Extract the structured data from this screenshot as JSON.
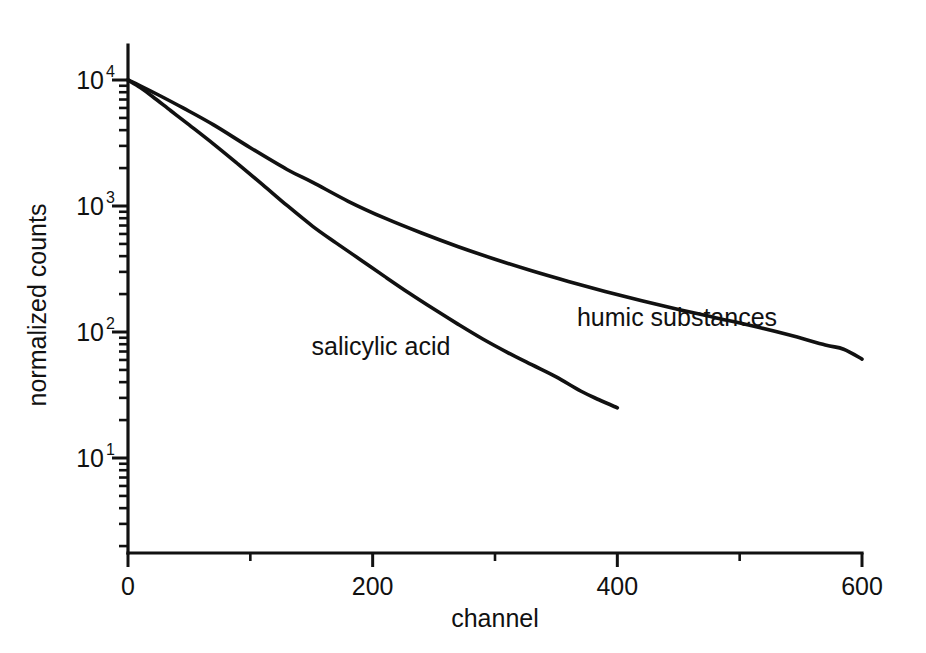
{
  "chart_data": {
    "type": "line",
    "title": "",
    "xlabel": "channel",
    "ylabel": "normalized counts",
    "xlim": [
      0,
      600
    ],
    "ylim": [
      1.8,
      17782
    ],
    "yscale": "log",
    "xscale": "linear",
    "grid": false,
    "legend_position": "inline-annotation",
    "xticks": [
      0,
      200,
      400,
      600
    ],
    "xticklabels": [
      "0",
      "200",
      "400",
      "600"
    ],
    "xminorticks": [
      100,
      300,
      500
    ],
    "yticks": [
      10,
      100,
      1000,
      10000
    ],
    "yticklabels": [
      "10",
      "10",
      "10",
      "10"
    ],
    "ytickexponents": [
      "1",
      "2",
      "3",
      "4"
    ],
    "series": [
      {
        "name": "salicylic acid",
        "label": "salicylic acid",
        "color": "#111111",
        "label_x": 150,
        "label_y": 66,
        "x": [
          0,
          10,
          20,
          35,
          50,
          70,
          90,
          110,
          130,
          151,
          170,
          190,
          210,
          230,
          250,
          270,
          290,
          310,
          330,
          350,
          370,
          385,
          400
        ],
        "y": [
          10000,
          8700,
          7400,
          5700,
          4400,
          3100,
          2150,
          1480,
          1010,
          690,
          510,
          375,
          275,
          203,
          152,
          115,
          88,
          69,
          55,
          44,
          34,
          29,
          25
        ]
      },
      {
        "name": "humic substances",
        "label": "humic substances",
        "color": "#111111",
        "label_x": 367,
        "label_y": 112,
        "x": [
          0,
          10,
          25,
          45,
          70,
          100,
          130,
          151,
          180,
          210,
          240,
          270,
          300,
          330,
          360,
          390,
          420,
          450,
          480,
          510,
          540,
          570,
          585,
          600
        ],
        "y": [
          10000,
          9000,
          7600,
          6000,
          4400,
          2900,
          1950,
          1540,
          1090,
          800,
          610,
          475,
          378,
          306,
          252,
          210,
          177,
          151,
          130,
          112,
          95,
          79,
          73,
          61
        ]
      }
    ],
    "annotations": [
      {
        "text": "salicylic acid",
        "x": 150,
        "y": 66
      },
      {
        "text": "humic substances",
        "x": 367,
        "y": 112
      }
    ]
  },
  "figure": {
    "background_color": "#ffffff",
    "foreground_color": "#111111"
  }
}
